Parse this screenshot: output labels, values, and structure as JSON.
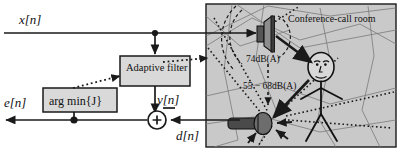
{
  "diagram": {
    "signals": {
      "input_x": "x[n]",
      "error_e": "e[n]",
      "filter_output_y": "y[n]",
      "desired_d": "d[n]"
    },
    "blocks": [
      {
        "id": "adaptive-filter",
        "label": "Adaptive filter"
      },
      {
        "id": "arg-min",
        "label": "arg min{J}"
      }
    ],
    "summing_junction": {
      "plus_sign": "+",
      "minus_sign": "−"
    },
    "room": {
      "label": "Conference-call room",
      "levels": [
        {
          "id": "loudspeaker-level",
          "text": "74dB(A)"
        },
        {
          "id": "talker-level",
          "text": "55 − 68dB(A)"
        }
      ],
      "icons": [
        {
          "id": "loudspeaker-icon",
          "name": "loudspeaker-icon"
        },
        {
          "id": "microphone-icon",
          "name": "microphone-icon"
        },
        {
          "id": "person-icon",
          "name": "stick-figure-person-icon"
        }
      ]
    },
    "colors": {
      "line": "#1a1a1a",
      "block_fill": "#d9d9d9",
      "room_fill": "#c9c9c9",
      "page": "#ffffff"
    }
  }
}
